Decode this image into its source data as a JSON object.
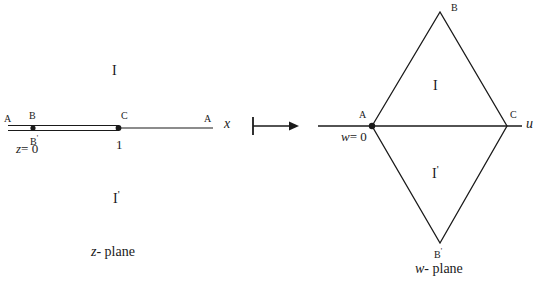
{
  "figure": {
    "ink_color": "#1a1a1a",
    "background_color": "#ffffff",
    "width": 545,
    "height": 290
  },
  "z_plane": {
    "caption_var": "z",
    "caption_rest": "- plane",
    "axis_label": "x",
    "origin_label_var": "z",
    "origin_label_rest": "= 0",
    "tick_label": "1",
    "points": {
      "a_left": "A",
      "a_right": "A",
      "b": "B",
      "b_prime_letter": "B",
      "b_prime_mark": "'",
      "c": "C"
    },
    "regions": {
      "upper_letter": "I",
      "lower_letter": "I",
      "lower_mark": "'"
    }
  },
  "mapping_arrow": {
    "symbol_name": "maps-to-arrow"
  },
  "w_plane": {
    "caption_var": "w",
    "caption_rest": "- plane",
    "axis_label": "u",
    "origin_label_var": "w",
    "origin_label_rest": "= 0",
    "points": {
      "a": "A",
      "b": "B",
      "c": "C",
      "b_prime_letter": "B",
      "b_prime_mark": "'"
    },
    "regions": {
      "upper_letter": "I",
      "lower_letter": "I",
      "lower_mark": "'"
    }
  }
}
